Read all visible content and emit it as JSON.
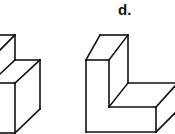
{
  "figures": [
    {
      "id": "figure-c-partial",
      "label": "",
      "description": "Stepped isometric block (partially cropped on left)"
    },
    {
      "id": "figure-d",
      "label": "d.",
      "description": "L-shaped isometric block"
    }
  ],
  "colors": {
    "line": "#111111",
    "background": "#ffffff"
  }
}
